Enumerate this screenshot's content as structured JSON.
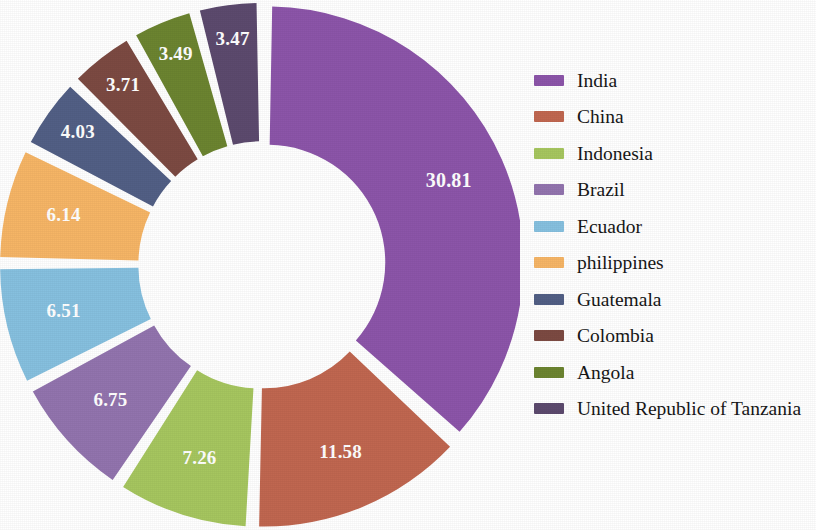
{
  "chart_data": {
    "type": "pie",
    "variant": "exploded-donut",
    "title": "",
    "subtitle": "",
    "xlabel": "",
    "ylabel": "",
    "grid": false,
    "legend_position": "right",
    "start_angle_deg": 0,
    "direction": "clockwise",
    "donut_hole_ratio": 0.46,
    "labels_inside_slices": true,
    "label_color": "#ffffff",
    "total": 83.75,
    "categories": [
      "India",
      "China",
      "Indonesia",
      "Brazil",
      "Ecuador",
      "philippines",
      "Guatemala",
      "Colombia",
      "Angola",
      "United Republic of Tanzania"
    ],
    "values": [
      30.81,
      11.58,
      7.26,
      6.75,
      6.51,
      6.14,
      4.03,
      3.71,
      3.49,
      3.47
    ],
    "value_labels": [
      "30.81",
      "11.58",
      "7.26",
      "6.75",
      "6.51",
      "6.14",
      "4.03",
      "3.71",
      "3.49",
      "3.47"
    ],
    "colors": [
      "#8C55A9",
      "#C06750",
      "#A6C65F",
      "#9274AE",
      "#86C0DF",
      "#F6B566",
      "#525F85",
      "#7C4A42",
      "#6C8430",
      "#5C4A6E"
    ],
    "slices": [
      {
        "label": "India",
        "value": 30.81,
        "value_label": "30.81",
        "color": "#8C55A9"
      },
      {
        "label": "China",
        "value": 11.58,
        "value_label": "11.58",
        "color": "#C06750"
      },
      {
        "label": "Indonesia",
        "value": 7.26,
        "value_label": "7.26",
        "color": "#A6C65F"
      },
      {
        "label": "Brazil",
        "value": 6.75,
        "value_label": "6.75",
        "color": "#9274AE"
      },
      {
        "label": "Ecuador",
        "value": 6.51,
        "value_label": "6.51",
        "color": "#86C0DF"
      },
      {
        "label": "philippines",
        "value": 6.14,
        "value_label": "6.14",
        "color": "#F6B566"
      },
      {
        "label": "Guatemala",
        "value": 4.03,
        "value_label": "4.03",
        "color": "#525F85"
      },
      {
        "label": "Colombia",
        "value": 3.71,
        "value_label": "3.71",
        "color": "#7C4A42"
      },
      {
        "label": "Angola",
        "value": 3.49,
        "value_label": "3.49",
        "color": "#6C8430"
      },
      {
        "label": "United Republic of Tanzania",
        "value": 3.47,
        "value_label": "3.47",
        "color": "#5C4A6E"
      }
    ]
  },
  "legend": {
    "items": [
      {
        "label": "India",
        "color": "#8C55A9"
      },
      {
        "label": "China",
        "color": "#C06750"
      },
      {
        "label": "Indonesia",
        "color": "#A6C65F"
      },
      {
        "label": "Brazil",
        "color": "#9274AE"
      },
      {
        "label": "Ecuador",
        "color": "#86C0DF"
      },
      {
        "label": "philippines",
        "color": "#F6B566"
      },
      {
        "label": "Guatemala",
        "color": "#525F85"
      },
      {
        "label": "Colombia",
        "color": "#7C4A42"
      },
      {
        "label": "Angola",
        "color": "#6C8430"
      },
      {
        "label": "United Republic of Tanzania",
        "color": "#5C4A6E"
      }
    ]
  }
}
